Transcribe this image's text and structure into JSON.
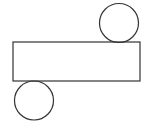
{
  "diagram": {
    "stroke_color": "#333333",
    "background": "#ffffff",
    "shapes": {
      "top_circle": {
        "cx": 119,
        "cy": 23,
        "r": 19.5
      },
      "rectangle": {
        "x": 13,
        "y": 42,
        "width": 127,
        "height": 39
      },
      "bottom_circle": {
        "cx": 34,
        "cy": 100.5,
        "r": 19.5
      }
    }
  }
}
